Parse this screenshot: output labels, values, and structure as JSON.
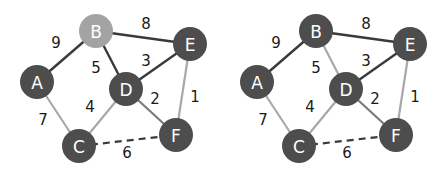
{
  "colors": {
    "node_dark": "#4d4d4d",
    "node_highlight": "#a3a3a3",
    "edge_dark": "#3a3a3a",
    "edge_light": "#a8a8a8",
    "edge_mid": "#7a7a7a",
    "label": "#1a1a1a",
    "node_text": "#ffffff"
  },
  "graphs": [
    {
      "id": "left",
      "offset_x": 0,
      "nodes": [
        {
          "id": "A",
          "label": "A",
          "x": 37,
          "y": 82,
          "highlight": false
        },
        {
          "id": "B",
          "label": "B",
          "x": 96,
          "y": 31,
          "highlight": true
        },
        {
          "id": "C",
          "label": "C",
          "x": 79,
          "y": 146,
          "highlight": false
        },
        {
          "id": "D",
          "label": "D",
          "x": 126,
          "y": 89,
          "highlight": false
        },
        {
          "id": "E",
          "label": "E",
          "x": 190,
          "y": 44,
          "highlight": false
        },
        {
          "id": "F",
          "label": "F",
          "x": 176,
          "y": 135,
          "highlight": false
        }
      ],
      "edges": [
        {
          "from": "A",
          "to": "B",
          "weight": "9",
          "style": "dark",
          "lx": 56,
          "ly": 43
        },
        {
          "from": "B",
          "to": "E",
          "weight": "8",
          "style": "dark",
          "lx": 146,
          "ly": 24
        },
        {
          "from": "B",
          "to": "D",
          "weight": "5",
          "style": "dark",
          "lx": 96,
          "ly": 68
        },
        {
          "from": "D",
          "to": "E",
          "weight": "3",
          "style": "dark",
          "lx": 146,
          "ly": 61
        },
        {
          "from": "A",
          "to": "C",
          "weight": "7",
          "style": "light",
          "lx": 43,
          "ly": 120
        },
        {
          "from": "C",
          "to": "D",
          "weight": "4",
          "style": "light",
          "lx": 90,
          "ly": 107
        },
        {
          "from": "D",
          "to": "F",
          "weight": "2",
          "style": "mid",
          "lx": 155,
          "ly": 99
        },
        {
          "from": "E",
          "to": "F",
          "weight": "1",
          "style": "light",
          "lx": 195,
          "ly": 97
        },
        {
          "from": "C",
          "to": "F",
          "weight": "6",
          "style": "dashed",
          "lx": 127,
          "ly": 153
        }
      ]
    },
    {
      "id": "right",
      "offset_x": 220,
      "nodes": [
        {
          "id": "A",
          "label": "A",
          "x": 37,
          "y": 82,
          "highlight": false
        },
        {
          "id": "B",
          "label": "B",
          "x": 96,
          "y": 31,
          "highlight": false
        },
        {
          "id": "C",
          "label": "C",
          "x": 79,
          "y": 146,
          "highlight": false
        },
        {
          "id": "D",
          "label": "D",
          "x": 126,
          "y": 89,
          "highlight": false
        },
        {
          "id": "E",
          "label": "E",
          "x": 190,
          "y": 44,
          "highlight": false
        },
        {
          "id": "F",
          "label": "F",
          "x": 176,
          "y": 135,
          "highlight": false
        }
      ],
      "edges": [
        {
          "from": "A",
          "to": "B",
          "weight": "9",
          "style": "dark",
          "lx": 56,
          "ly": 43
        },
        {
          "from": "B",
          "to": "E",
          "weight": "8",
          "style": "dark",
          "lx": 146,
          "ly": 24
        },
        {
          "from": "B",
          "to": "D",
          "weight": "5",
          "style": "light",
          "lx": 96,
          "ly": 68
        },
        {
          "from": "D",
          "to": "E",
          "weight": "3",
          "style": "dark",
          "lx": 146,
          "ly": 61
        },
        {
          "from": "A",
          "to": "C",
          "weight": "7",
          "style": "light",
          "lx": 43,
          "ly": 120
        },
        {
          "from": "C",
          "to": "D",
          "weight": "4",
          "style": "light",
          "lx": 90,
          "ly": 107
        },
        {
          "from": "D",
          "to": "F",
          "weight": "2",
          "style": "mid",
          "lx": 155,
          "ly": 99
        },
        {
          "from": "E",
          "to": "F",
          "weight": "1",
          "style": "light",
          "lx": 195,
          "ly": 97
        },
        {
          "from": "C",
          "to": "F",
          "weight": "6",
          "style": "dashed",
          "lx": 127,
          "ly": 153
        }
      ]
    }
  ]
}
